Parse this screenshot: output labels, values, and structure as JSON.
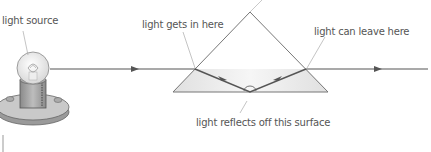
{
  "labels": {
    "light_source": "light source",
    "light_in": "light gets in here",
    "light_out": "light can leave here",
    "reflects": "light reflects off this surface"
  },
  "colors": {
    "ray": "#555555",
    "prism_outline": "#777777",
    "prism_fill": "#e4e4e4",
    "text": "#555555"
  }
}
